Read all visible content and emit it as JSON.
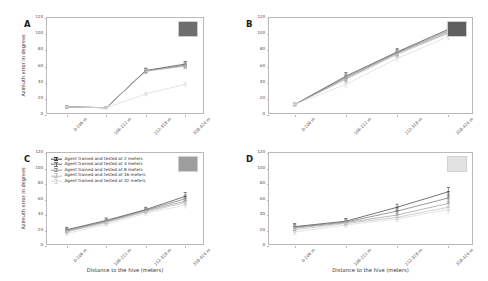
{
  "figure": {
    "xlabel": "Distance to the hive (meters)",
    "ylabel": "Azimuth error in degrees",
    "panel_letters": [
      "A",
      "B",
      "C",
      "D"
    ]
  },
  "legend": {
    "position": "upper-left-panel-C",
    "entries": [
      {
        "label": "Agent trained and tested at 2 meters",
        "color": "#3a3a3a"
      },
      {
        "label": "Agent trained and tested at 4 meters",
        "color": "#6e6e6e"
      },
      {
        "label": "Agent trained and tested at 8 meters",
        "color": "#9a9a9a"
      },
      {
        "label": "Agent trained and tested at 16 meters",
        "color": "#bdbdbd"
      },
      {
        "label": "Agent trained and tested at 32 meters",
        "color": "#d8d8d8"
      }
    ]
  },
  "insets": {
    "A": {
      "name": "texture-inset-dark-grey",
      "color": "#6d6d6d"
    },
    "B": {
      "name": "texture-inset-dark-grey",
      "color": "#5f5f5f"
    },
    "C": {
      "name": "texture-inset-mid-grey",
      "color": "#9e9e9e"
    },
    "D": {
      "name": "texture-inset-light-grey",
      "color": "#e2e2e2"
    }
  },
  "chart_data": [
    {
      "type": "line",
      "panel": "A",
      "title": "A",
      "xlabel": "Distance to the hive (meters)",
      "ylabel": "Azimuth error in degrees",
      "categories": [
        "0-106 m",
        "106-212 m",
        "212-318 m",
        "318-424 m"
      ],
      "ylim": [
        0,
        120
      ],
      "yticks": [
        0,
        20,
        40,
        60,
        80,
        100,
        120
      ],
      "grid": false,
      "series": [
        {
          "name": "Agent trained and tested at 2 meters",
          "color": "#3a3a3a",
          "values": [
            10.0,
            9.0,
            55.0,
            63.0
          ],
          "err": [
            1.2,
            1.0,
            2.8,
            3.2
          ]
        },
        {
          "name": "Agent trained and tested at 4 meters",
          "color": "#6e6e6e",
          "values": [
            10.0,
            9.0,
            55.0,
            61.5
          ],
          "err": [
            1.2,
            1.0,
            2.6,
            3.0
          ]
        },
        {
          "name": "Agent trained and tested at 8 meters",
          "color": "#9a9a9a",
          "values": [
            10.0,
            9.0,
            54.5,
            61.0
          ],
          "err": [
            1.1,
            1.0,
            2.5,
            2.9
          ]
        },
        {
          "name": "Agent trained and tested at 16 meters",
          "color": "#bdbdbd",
          "values": [
            10.0,
            9.0,
            54.0,
            60.5
          ],
          "err": [
            1.1,
            1.0,
            2.4,
            2.8
          ]
        },
        {
          "name": "Agent trained and tested at 32 meters",
          "color": "#d8d8d8",
          "values": [
            10.0,
            9.0,
            26.0,
            38.0
          ],
          "err": [
            1.0,
            1.0,
            2.2,
            2.6
          ]
        }
      ]
    },
    {
      "type": "line",
      "panel": "B",
      "title": "B",
      "xlabel": "Distance to the hive (meters)",
      "ylabel": "Azimuth error in degrees",
      "categories": [
        "0-106 m",
        "106-212 m",
        "212-318 m",
        "318-424 m"
      ],
      "ylim": [
        0,
        120
      ],
      "yticks": [
        0,
        20,
        40,
        60,
        80,
        100,
        120
      ],
      "grid": false,
      "series": [
        {
          "name": "Agent trained and tested at 2 meters",
          "color": "#3a3a3a",
          "values": [
            13.0,
            48.0,
            78.0,
            106.0
          ],
          "err": [
            1.5,
            4.5,
            4.0,
            4.5
          ]
        },
        {
          "name": "Agent trained and tested at 4 meters",
          "color": "#6e6e6e",
          "values": [
            13.0,
            46.5,
            77.0,
            104.0
          ],
          "err": [
            1.5,
            4.2,
            3.8,
            4.2
          ]
        },
        {
          "name": "Agent trained and tested at 8 meters",
          "color": "#9a9a9a",
          "values": [
            13.0,
            45.0,
            76.0,
            102.0
          ],
          "err": [
            1.4,
            4.0,
            3.6,
            4.0
          ]
        },
        {
          "name": "Agent trained and tested at 16 meters",
          "color": "#bdbdbd",
          "values": [
            13.0,
            44.0,
            75.0,
            101.0
          ],
          "err": [
            1.4,
            3.8,
            3.5,
            3.8
          ]
        },
        {
          "name": "Agent trained and tested at 32 meters",
          "color": "#d8d8d8",
          "values": [
            13.0,
            38.0,
            70.0,
            97.0
          ],
          "err": [
            1.3,
            3.5,
            3.2,
            3.6
          ]
        }
      ]
    },
    {
      "type": "line",
      "panel": "C",
      "title": "C",
      "xlabel": "Distance to the hive (meters)",
      "ylabel": "Azimuth error in degrees",
      "categories": [
        "0-106 m",
        "106-212 m",
        "212-318 m",
        "318-424 m"
      ],
      "ylim": [
        0,
        120
      ],
      "yticks": [
        0,
        20,
        40,
        60,
        80,
        100,
        120
      ],
      "grid": false,
      "series": [
        {
          "name": "Agent trained and tested at 2 meters",
          "color": "#3a3a3a",
          "values": [
            21.0,
            33.0,
            47.0,
            64.0
          ],
          "err": [
            3.0,
            3.2,
            3.0,
            5.0
          ]
        },
        {
          "name": "Agent trained and tested at 4 meters",
          "color": "#6e6e6e",
          "values": [
            20.0,
            32.0,
            46.0,
            61.0
          ],
          "err": [
            2.8,
            3.0,
            2.8,
            4.6
          ]
        },
        {
          "name": "Agent trained and tested at 8 meters",
          "color": "#9a9a9a",
          "values": [
            19.0,
            31.0,
            45.0,
            58.0
          ],
          "err": [
            2.6,
            2.8,
            2.6,
            4.2
          ]
        },
        {
          "name": "Agent trained and tested at 16 meters",
          "color": "#bdbdbd",
          "values": [
            18.0,
            30.0,
            44.0,
            56.0
          ],
          "err": [
            2.4,
            2.6,
            2.4,
            4.0
          ]
        },
        {
          "name": "Agent trained and tested at 32 meters",
          "color": "#d8d8d8",
          "values": [
            16.0,
            28.0,
            42.0,
            53.0
          ],
          "err": [
            2.2,
            2.4,
            2.2,
            3.8
          ]
        }
      ]
    },
    {
      "type": "line",
      "panel": "D",
      "title": "D",
      "xlabel": "Distance to the hive (meters)",
      "ylabel": "Azimuth error in degrees",
      "categories": [
        "0-106 m",
        "106-212 m",
        "212-318 m",
        "318-424 m"
      ],
      "ylim": [
        0,
        120
      ],
      "yticks": [
        0,
        20,
        40,
        60,
        80,
        100,
        120
      ],
      "grid": false,
      "series": [
        {
          "name": "Agent trained and tested at 2 meters",
          "color": "#3a3a3a",
          "values": [
            25.0,
            32.0,
            50.0,
            70.0
          ],
          "err": [
            4.0,
            3.5,
            4.0,
            5.5
          ]
        },
        {
          "name": "Agent trained and tested at 4 meters",
          "color": "#6e6e6e",
          "values": [
            24.0,
            31.0,
            45.0,
            62.0
          ],
          "err": [
            3.8,
            3.4,
            3.8,
            5.0
          ]
        },
        {
          "name": "Agent trained and tested at 8 meters",
          "color": "#9a9a9a",
          "values": [
            23.0,
            30.0,
            40.0,
            55.0
          ],
          "err": [
            3.6,
            3.2,
            3.6,
            4.6
          ]
        },
        {
          "name": "Agent trained and tested at 16 meters",
          "color": "#bdbdbd",
          "values": [
            21.0,
            29.0,
            37.0,
            50.0
          ],
          "err": [
            3.4,
            3.0,
            3.4,
            4.2
          ]
        },
        {
          "name": "Agent trained and tested at 32 meters",
          "color": "#d8d8d8",
          "values": [
            18.0,
            27.0,
            35.0,
            47.0
          ],
          "err": [
            3.2,
            2.8,
            3.2,
            4.0
          ]
        }
      ]
    }
  ]
}
